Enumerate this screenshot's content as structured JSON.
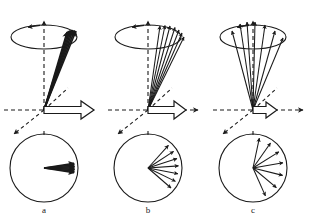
{
  "figure": {
    "name": "spin-dephasing-diagram",
    "width": 311,
    "height": 223,
    "background": "#ffffff",
    "stroke_color": "#1a1a1a",
    "hollow_arrow_fill": "#ffffff",
    "panel_count": 3
  },
  "panels": [
    {
      "id": "a",
      "label": "a",
      "label_x": 44,
      "label_y": 213,
      "origin_x": 44,
      "origin_y": 110,
      "description": "tightly-clustered-spin-vectors",
      "axis": {
        "vertical_top_y": 14,
        "horizontal_left_x": 4,
        "horizontal_right_x": 100,
        "diag_up_right_x": 68,
        "diag_up_right_y": 88,
        "diag_down_left_x": 10,
        "diag_down_left_y": 138
      },
      "ellipse": {
        "cx": 44,
        "cy": 37,
        "rx": 33,
        "ry": 12
      },
      "cone_vectors": {
        "count": 7,
        "tip_xs": [
          67,
          68.5,
          70,
          71.5,
          73,
          74.5,
          76
        ],
        "tip_ys": [
          32,
          31,
          30.5,
          30,
          30,
          30.5,
          31
        ],
        "spread": "narrow"
      },
      "circle": {
        "cx": 44,
        "cy": 168,
        "r": 34
      },
      "fan_angles_deg": [
        -9,
        -6,
        -3,
        0,
        3,
        6,
        9
      ],
      "fan_label": "near-coherent",
      "hollow_arrow": {
        "x1": 44,
        "x2": 94,
        "thickness": 7,
        "head_len": 13,
        "head_half": 9
      }
    },
    {
      "id": "b",
      "label": "b",
      "label_x": 148,
      "label_y": 213,
      "origin_x": 148,
      "origin_y": 110,
      "description": "moderately-fanned-spin-vectors",
      "axis": {
        "vertical_top_y": 14,
        "horizontal_left_x": 108,
        "horizontal_right_x": 204,
        "diag_up_right_x": 172,
        "diag_up_right_y": 88,
        "diag_down_left_x": 114,
        "diag_down_left_y": 138
      },
      "ellipse": {
        "cx": 148,
        "cy": 37,
        "rx": 33,
        "ry": 12
      },
      "cone_vectors": {
        "count": 7,
        "tip_xs": [
          160,
          165,
          170,
          175,
          179,
          182,
          184
        ],
        "tip_ys": [
          26,
          25.5,
          26,
          27.5,
          30,
          33,
          37
        ],
        "spread": "medium"
      },
      "circle": {
        "cx": 148,
        "cy": 168,
        "r": 34
      },
      "fan_angles_deg": [
        -48,
        -33,
        -18,
        -4,
        11,
        26,
        41
      ],
      "fan_label": "partially-dephased",
      "hollow_arrow": {
        "x1": 148,
        "x2": 186,
        "thickness": 7,
        "head_len": 12,
        "head_half": 9
      }
    },
    {
      "id": "c",
      "label": "c",
      "label_x": 253,
      "label_y": 213,
      "origin_x": 253,
      "origin_y": 110,
      "description": "widely-fanned-spin-vectors",
      "axis": {
        "vertical_top_y": 14,
        "horizontal_left_x": 213,
        "horizontal_right_x": 309,
        "diag_up_right_x": 277,
        "diag_up_right_y": 88,
        "diag_down_left_x": 219,
        "diag_down_left_y": 138
      },
      "ellipse": {
        "cx": 253,
        "cy": 37,
        "rx": 33,
        "ry": 12
      },
      "cone_vectors": {
        "count": 7,
        "tip_xs": [
          232,
          240,
          247,
          255,
          265,
          275,
          283
        ],
        "tip_ys": [
          31,
          24,
          22,
          22,
          25,
          31,
          38
        ],
        "spread": "wide"
      },
      "circle": {
        "cx": 253,
        "cy": 168,
        "r": 34
      },
      "fan_angles_deg": [
        -78,
        -55,
        -32,
        -10,
        14,
        40,
        66
      ],
      "fan_label": "fully-dephased",
      "hollow_arrow": {
        "x1": 253,
        "x2": 277,
        "thickness": 7,
        "head_len": 11,
        "head_half": 8
      }
    }
  ]
}
